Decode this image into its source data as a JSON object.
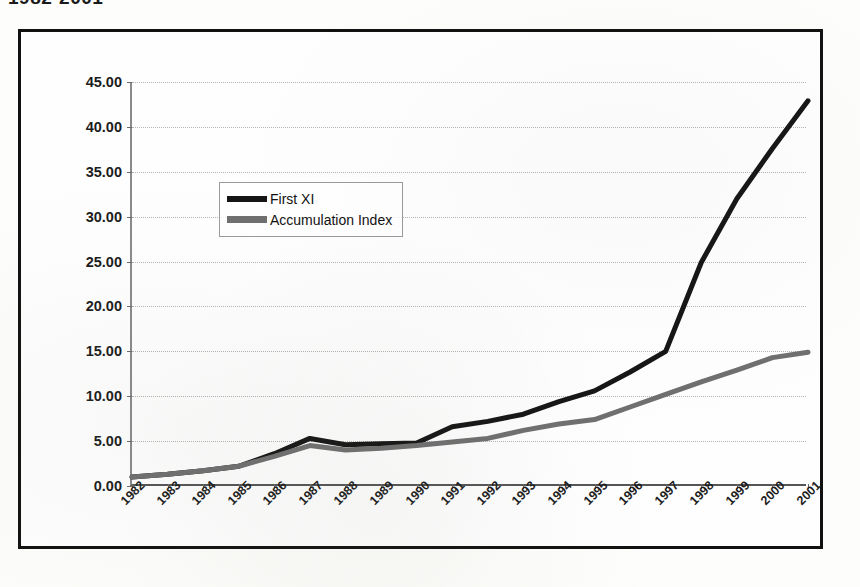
{
  "caption": "1982-2001",
  "legend": {
    "position": "inside-top-left",
    "items": [
      {
        "label": "First XI",
        "color": "#151515",
        "icon": "line-swatch-dark"
      },
      {
        "label": "Accumulation Index",
        "color": "#6f6f6f",
        "icon": "line-swatch-gray"
      }
    ]
  },
  "chart_data": {
    "type": "line",
    "title": "1982-2001",
    "xlabel": "",
    "ylabel": "",
    "grid": true,
    "legend_position": "inside-top-left",
    "ylim": [
      0,
      45
    ],
    "ytick_labels": [
      "0.00",
      "5.00",
      "10.00",
      "15.00",
      "20.00",
      "25.00",
      "30.00",
      "35.00",
      "40.00",
      "45.00"
    ],
    "ytick_values": [
      0,
      5,
      10,
      15,
      20,
      25,
      30,
      35,
      40,
      45
    ],
    "categories": [
      "1982",
      "1983",
      "1984",
      "1985",
      "1986",
      "1987",
      "1988",
      "1989",
      "1990",
      "1991",
      "1992",
      "1993",
      "1994",
      "1995",
      "1996",
      "1997",
      "1998",
      "1999",
      "2000",
      "2001"
    ],
    "series": [
      {
        "name": "First XI",
        "color": "#151515",
        "values": [
          1.0,
          1.3,
          1.7,
          2.2,
          3.6,
          5.3,
          4.6,
          4.7,
          4.8,
          6.6,
          7.2,
          8.0,
          9.4,
          10.6,
          12.7,
          15.0,
          24.9,
          32.0,
          37.6,
          42.9
        ]
      },
      {
        "name": "Accumulation Index",
        "color": "#6f6f6f",
        "values": [
          1.0,
          1.3,
          1.7,
          2.2,
          3.3,
          4.5,
          4.0,
          4.2,
          4.5,
          4.9,
          5.3,
          6.2,
          6.9,
          7.4,
          8.8,
          10.2,
          11.6,
          12.9,
          14.3,
          14.9
        ]
      }
    ]
  }
}
